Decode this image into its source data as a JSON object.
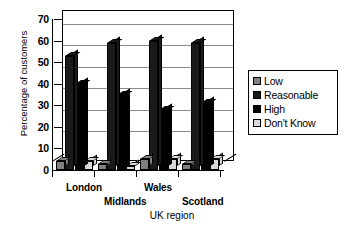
{
  "chart_data": {
    "type": "bar",
    "title": "",
    "xlabel": "UK region",
    "ylabel": "Percentage of customers",
    "categories": [
      "London",
      "Midlands",
      "Wales",
      "Scotland"
    ],
    "series": [
      {
        "name": "Low",
        "color": "#808080",
        "values": [
          4,
          3,
          5,
          3
        ]
      },
      {
        "name": "Reasonable",
        "color": "#1a1a1a",
        "values": [
          53,
          59,
          60,
          59
        ]
      },
      {
        "name": "High",
        "color": "#000000",
        "values": [
          40,
          35,
          28,
          31
        ]
      },
      {
        "name": "Don't Know",
        "color": "#d9d9d9",
        "values": [
          4,
          2,
          5,
          5
        ]
      }
    ],
    "ylim": [
      0,
      70
    ],
    "yticks": [
      0,
      10,
      20,
      30,
      40,
      50,
      60,
      70
    ],
    "ytick_labels": [
      "0",
      "10",
      "20",
      "30",
      "40",
      "50",
      "60",
      "70"
    ],
    "grid": true,
    "legend_position": "right",
    "legend_entries": [
      "Low",
      "Reasonable",
      "High",
      "Don't Know"
    ],
    "style": "3d-column"
  }
}
